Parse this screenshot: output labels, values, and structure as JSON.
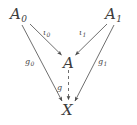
{
  "diagram": {
    "type": "commutative-diagram",
    "background_color": "#ffffff",
    "ink_color": "#3c3c3c",
    "nodes": [
      {
        "id": "A0",
        "base": "A",
        "sub": "0",
        "x": 20,
        "y": 16
      },
      {
        "id": "A1",
        "base": "A",
        "sub": "1",
        "x": 113,
        "y": 16
      },
      {
        "id": "A",
        "base": "A",
        "sub": "",
        "x": 68,
        "y": 62
      },
      {
        "id": "X",
        "base": "X",
        "sub": "",
        "x": 68,
        "y": 110
      }
    ],
    "edges": [
      {
        "id": "iota0",
        "base": "ι",
        "sub": "0",
        "from": "A0",
        "to": "A",
        "style": "solid",
        "label_x": 46,
        "label_y": 33
      },
      {
        "id": "iota1",
        "base": "ι",
        "sub": "1",
        "from": "A1",
        "to": "A",
        "style": "solid",
        "label_x": 82,
        "label_y": 33
      },
      {
        "id": "g0",
        "base": "g",
        "sub": "0",
        "from": "A0",
        "to": "X",
        "style": "solid",
        "label_x": 29,
        "label_y": 62
      },
      {
        "id": "g1",
        "base": "g",
        "sub": "1",
        "from": "A1",
        "to": "X",
        "style": "solid",
        "label_x": 100,
        "label_y": 62
      },
      {
        "id": "g",
        "base": "g",
        "sub": "",
        "from": "A",
        "to": "X",
        "style": "dashed",
        "label_x": 58,
        "label_y": 86
      }
    ]
  }
}
